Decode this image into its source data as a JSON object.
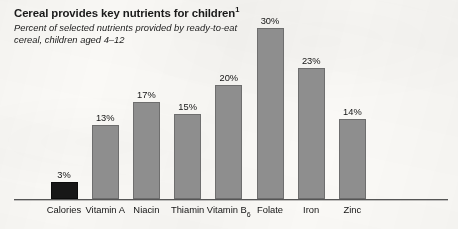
{
  "header": {
    "title": "Cereal provides key nutrients for children",
    "title_footnote": "1",
    "subtitle": "Percent of selected nutrients provided by ready-to-eat cereal, children aged 4–12"
  },
  "colors": {
    "bar_gray": "#8e8e8e",
    "bar_gray_border": "#6e6e6e",
    "bar_dark": "#171717",
    "axis": "#555555",
    "background": "#fbfaf7",
    "text": "#1a1a1a"
  },
  "chart_data": {
    "type": "bar",
    "title": "Cereal provides key nutrients for children",
    "subtitle": "Percent of selected nutrients provided by ready-to-eat cereal, children aged 4–12",
    "xlabel": "",
    "ylabel": "",
    "ylim": [
      0,
      30
    ],
    "grid": false,
    "legend": "none",
    "value_suffix": "%",
    "categories": [
      "Calories",
      "Vitamin A",
      "Niacin",
      "Thiamin",
      "Vitamin B6",
      "Folate",
      "Iron",
      "Zinc"
    ],
    "category_labels": [
      "Calories",
      "Vitamin A",
      "Niacin",
      "Thiamin",
      "Vitamin B",
      "Folate",
      "Iron",
      "Zinc"
    ],
    "values": [
      3,
      13,
      17,
      15,
      20,
      30,
      23,
      14
    ],
    "value_labels": [
      "3%",
      "13%",
      "17%",
      "15%",
      "20%",
      "30%",
      "23%",
      "14%"
    ],
    "bar_colors": [
      "#171717",
      "#8e8e8e",
      "#8e8e8e",
      "#8e8e8e",
      "#8e8e8e",
      "#8e8e8e",
      "#8e8e8e",
      "#8e8e8e"
    ],
    "subscripts": [
      "",
      "",
      "",
      "",
      "6",
      "",
      "",
      ""
    ]
  }
}
